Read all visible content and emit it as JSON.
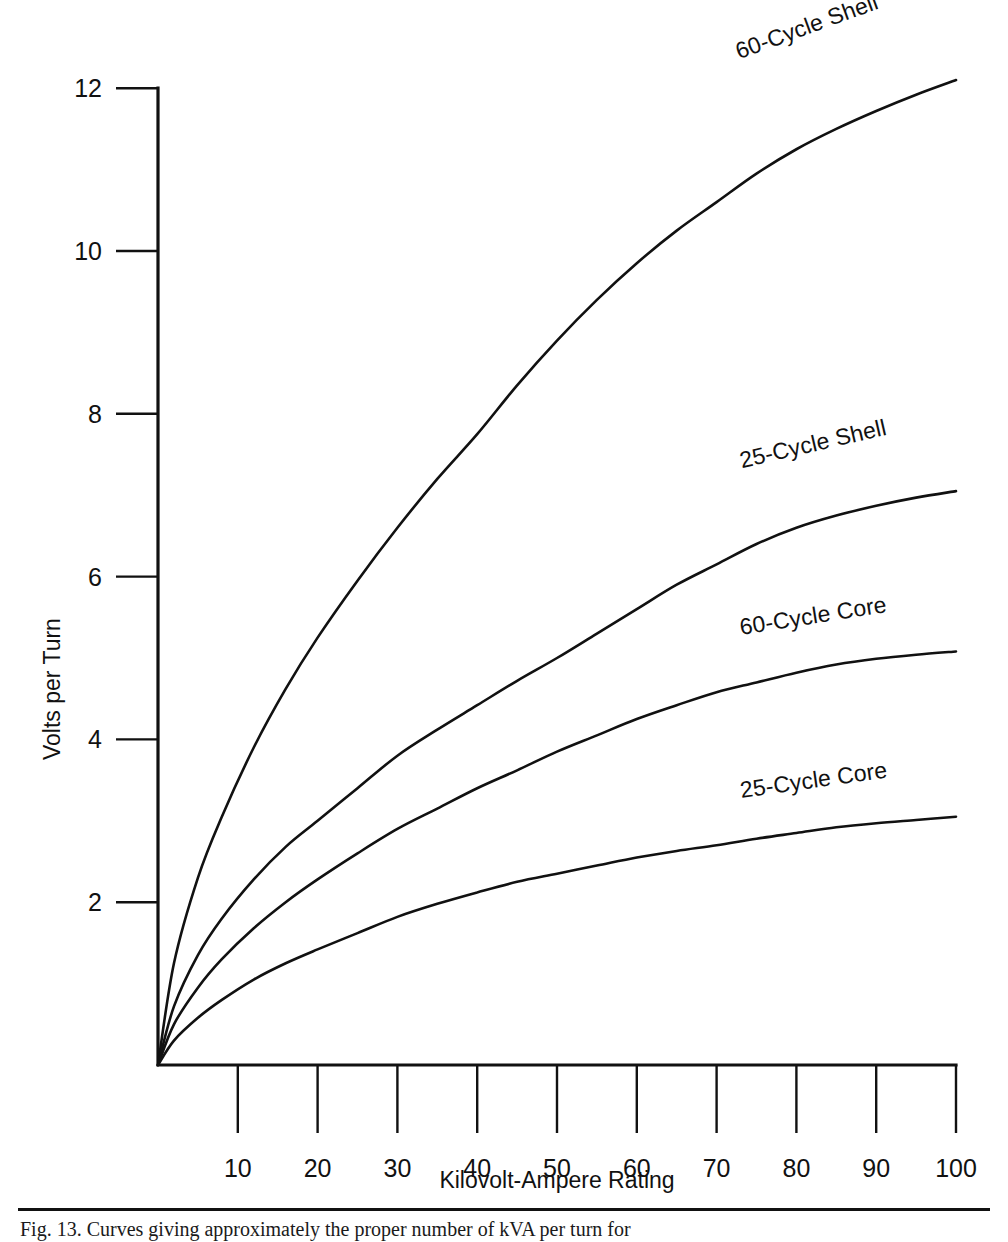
{
  "figure": {
    "background_color": "#ffffff",
    "ink_color": "#111111",
    "caption": "Fig. 13.    Curves giving approximately the proper number of kVA per turn for"
  },
  "chart_data": {
    "type": "line",
    "title": "",
    "xlabel": "Kilovolt-Ampere Rating",
    "ylabel": "Volts per Turn",
    "xlim": [
      0,
      100
    ],
    "ylim": [
      0,
      12.6
    ],
    "grid": false,
    "legend_position": "inline-curve-labels",
    "x_ticks": [
      10,
      20,
      30,
      40,
      50,
      60,
      70,
      80,
      90,
      100
    ],
    "x_tick_labels": [
      "10",
      "20",
      "30",
      "40",
      "50",
      "60",
      "70",
      "80",
      "90",
      "100"
    ],
    "y_ticks": [
      2,
      4,
      6,
      8,
      10,
      12
    ],
    "y_tick_labels": [
      "2",
      "4",
      "6",
      "8",
      "10",
      "12"
    ],
    "x": [
      0,
      2,
      5,
      8,
      12,
      16,
      20,
      25,
      30,
      35,
      40,
      45,
      50,
      55,
      60,
      65,
      70,
      75,
      80,
      85,
      90,
      95,
      100
    ],
    "series": [
      {
        "name": "60-Cycle Shell",
        "label": "60-Cycle Shell",
        "label_rotation_deg": -20,
        "values": [
          0,
          1.25,
          2.3,
          3.05,
          3.9,
          4.62,
          5.25,
          5.95,
          6.6,
          7.2,
          7.75,
          8.35,
          8.9,
          9.4,
          9.85,
          10.25,
          10.6,
          10.95,
          11.25,
          11.5,
          11.72,
          11.92,
          12.1
        ]
      },
      {
        "name": "25-Cycle Shell",
        "label": "25-Cycle Shell",
        "label_rotation_deg": -13,
        "values": [
          0,
          0.72,
          1.35,
          1.8,
          2.28,
          2.68,
          3.0,
          3.4,
          3.8,
          4.12,
          4.42,
          4.72,
          5.0,
          5.3,
          5.6,
          5.9,
          6.15,
          6.4,
          6.6,
          6.75,
          6.87,
          6.97,
          7.05
        ]
      },
      {
        "name": "60-Cycle Core",
        "label": "60-Cycle Core",
        "label_rotation_deg": -9,
        "values": [
          0,
          0.5,
          0.95,
          1.3,
          1.68,
          2.0,
          2.28,
          2.6,
          2.9,
          3.15,
          3.4,
          3.62,
          3.85,
          4.05,
          4.25,
          4.42,
          4.58,
          4.7,
          4.82,
          4.92,
          4.99,
          5.04,
          5.08
        ]
      },
      {
        "name": "25-Cycle Core",
        "label": "25-Cycle Core",
        "label_rotation_deg": -8,
        "values": [
          0,
          0.3,
          0.58,
          0.8,
          1.05,
          1.25,
          1.42,
          1.62,
          1.82,
          1.98,
          2.12,
          2.25,
          2.35,
          2.45,
          2.55,
          2.63,
          2.7,
          2.78,
          2.85,
          2.92,
          2.97,
          3.01,
          3.05
        ]
      }
    ]
  },
  "labels": {
    "series_label_positions": [
      {
        "name": "60-Cycle-Shell",
        "left": 741,
        "top": 38
      },
      {
        "name": "25-Cycle-Shell",
        "left": 743,
        "top": 447
      },
      {
        "name": "60-Cycle-Core",
        "left": 742,
        "top": 614
      },
      {
        "name": "25-Cycle-Core",
        "left": 742,
        "top": 777
      }
    ]
  }
}
